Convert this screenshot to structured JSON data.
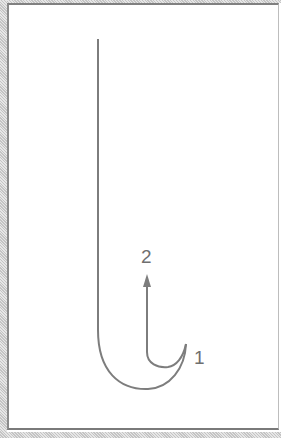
{
  "diagram": {
    "type": "hook-motion-diagram",
    "stroke_color": "#7d7d7d",
    "labels": {
      "start": "1",
      "end": "2"
    },
    "arrow": {
      "direction": "up",
      "from_label": "1",
      "to_label": "2"
    }
  }
}
